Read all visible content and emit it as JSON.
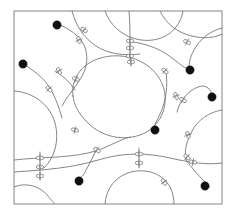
{
  "figure": {
    "canvas": {
      "width": 236,
      "height": 215
    },
    "background_color": "#ffffff",
    "frame": {
      "name": "bounding-frame",
      "x": 14,
      "y": 11,
      "width": 208,
      "height": 193,
      "stroke_color": "#8e8e8e",
      "stroke_width": 1.1,
      "fill_color": "#ffffff"
    },
    "style": {
      "curve_color": "#6f6f6f",
      "curve_width": 0.85,
      "crossing_color": "#7a7a7a",
      "crossing_fill": "#ffffff",
      "dot_color": "#101010",
      "dot_radius": 4.2
    },
    "curves": [
      {
        "id": "curve-central-loop",
        "label": "large central closed loop",
        "d": "M 73 96 C 70 74 88 58 111 56 C 134 54 156 66 163 86 C 170 106 160 128 140 135 C 120 142 98 135 85 120 C 77 111 74 104 73 96 Z"
      },
      {
        "id": "curve-upper-left-arc",
        "label": "upper-left descending arc from dot",
        "d": "M 56 23 C 68 28 79 35 84 45 C 89 56 87 68 81 78 C 75 88 67 96 62 106"
      },
      {
        "id": "curve-left-upper-sweep",
        "label": "left sweep from left dot through mid-left",
        "d": "M 22 63 C 33 70 44 78 50 88 C 56 98 59 108 62 118"
      },
      {
        "id": "curve-left-big-circle",
        "label": "left partial circle exiting frame",
        "d": "M 14 91 C 32 92 48 103 54 120 C 60 137 56 156 44 168"
      },
      {
        "id": "curve-top-left-to-top",
        "label": "top boundary arc near top-left",
        "d": "M 72 11 C 76 26 84 38 96 46 C 108 54 124 56 140 54"
      },
      {
        "id": "curve-top-center-dome",
        "label": "top-center dome arc",
        "d": "M 105 11 C 110 25 121 35 136 39 C 152 43 168 38 176 27 C 180 22 182 17 183 11"
      },
      {
        "id": "curve-top-right-arc",
        "label": "top-right arc to right border",
        "d": "M 160 11 C 166 24 178 33 192 36 C 204 39 214 38 222 34"
      },
      {
        "id": "curve-right-upper-hook",
        "label": "right upper hook ending at dot",
        "d": "M 222 28 C 210 31 200 39 194 50 C 190 57 189 63 189 68"
      },
      {
        "id": "curve-upper-right-branch",
        "label": "branch from top-center crossing to right dot",
        "d": "M 133 42 C 148 44 162 50 172 58 C 180 64 186 70 189 68"
      },
      {
        "id": "curve-right-swing",
        "label": "right side swing to right-edge dot",
        "d": "M 177 112 C 180 100 188 91 198 87 C 206 84 212 89 212 97"
      },
      {
        "id": "curve-right-lower-s",
        "label": "right lower S curve",
        "d": "M 222 110 C 209 112 198 120 192 131 C 186 142 184 152 186 160"
      },
      {
        "id": "curve-center-to-dot",
        "label": "arc from central loop to center dot",
        "d": "M 166 72 C 168 86 166 100 161 112 C 157 121 153 127 154 129"
      },
      {
        "id": "curve-center-bottom-strand",
        "label": "long bottom strand crossing center",
        "d": "M 14 160 C 40 157 66 158 88 153 C 106 149 118 140 130 137"
      },
      {
        "id": "curve-bottom-long-sweep",
        "label": "long sweep across lower area",
        "d": "M 14 172 C 44 170 72 168 98 160 C 124 152 148 153 170 158 C 192 163 208 165 222 163"
      },
      {
        "id": "curve-bottom-left-circle",
        "label": "bottom-left partial circle",
        "d": "M 14 187 C 26 182 40 186 48 196 C 52 201 54 203 55 204"
      },
      {
        "id": "curve-bottom-center-dome",
        "label": "bottom-center dome arc",
        "d": "M 105 204 C 106 188 116 176 131 172 C 147 168 163 174 170 187 C 173 193 174 199 174 204"
      },
      {
        "id": "curve-bottom-dot-hook",
        "label": "hook from bottom strand to bottom-left dot",
        "d": "M 97 147 C 94 155 90 163 86 170 C 84 175 81 178 79 179"
      },
      {
        "id": "curve-bottom-right-tail",
        "label": "tail to bottom-right dot",
        "d": "M 186 160 C 192 168 198 175 204 181 C 207 184 209 186 210 187"
      },
      {
        "id": "curve-mid-left-link",
        "label": "mid-left link joining loop and left arc",
        "d": "M 55 71 C 63 76 70 82 75 90"
      },
      {
        "id": "curve-center-vertical",
        "label": "vertical strand through center-top crossings",
        "d": "M 129 11 C 130 22 130 32 130 44 C 130 54 130 60 131 66"
      },
      {
        "id": "curve-left-vertical-ladder",
        "label": "short vertical strand crossing three horizontals",
        "d": "M 40 152 C 40 162 40 172 40 180"
      },
      {
        "id": "curve-bottom-right-vertical",
        "label": "vertical strand near bottom-center right",
        "d": "M 139 148 C 139 156 139 162 139 168"
      }
    ],
    "crossings": [
      {
        "id": "crossing-1",
        "label": "crossing upper-left",
        "x": 84,
        "y": 30,
        "angle": 35
      },
      {
        "id": "crossing-2",
        "label": "crossing upper-left lower",
        "x": 79,
        "y": 40,
        "angle": 70
      },
      {
        "id": "crossing-3",
        "label": "crossing top-center upper",
        "x": 130,
        "y": 41,
        "angle": 0
      },
      {
        "id": "crossing-4",
        "label": "crossing top-center mid",
        "x": 130,
        "y": 48,
        "angle": 0
      },
      {
        "id": "crossing-5",
        "label": "crossing top-center lower",
        "x": 130,
        "y": 56,
        "angle": 0
      },
      {
        "id": "crossing-6",
        "label": "crossing top-right",
        "x": 187,
        "y": 42,
        "angle": 25
      },
      {
        "id": "crossing-7",
        "label": "crossing left-mid upper",
        "x": 59,
        "y": 71,
        "angle": 60
      },
      {
        "id": "crossing-8",
        "label": "crossing left-mid lower",
        "x": 49,
        "y": 89,
        "angle": 45
      },
      {
        "id": "crossing-9",
        "label": "crossing central-left",
        "x": 76,
        "y": 79,
        "angle": 20
      },
      {
        "id": "crossing-10",
        "label": "crossing central-loop top",
        "x": 131,
        "y": 62,
        "angle": 0
      },
      {
        "id": "crossing-11",
        "label": "crossing central-loop right",
        "x": 165,
        "y": 71,
        "angle": 40
      },
      {
        "id": "crossing-12",
        "label": "crossing right-mid upper",
        "x": 176,
        "y": 96,
        "angle": 70
      },
      {
        "id": "crossing-13",
        "label": "crossing right-mid lower",
        "x": 183,
        "y": 100,
        "angle": 30
      },
      {
        "id": "crossing-14",
        "label": "crossing left-loop lower",
        "x": 75,
        "y": 130,
        "angle": 15
      },
      {
        "id": "crossing-15",
        "label": "crossing right-lower",
        "x": 188,
        "y": 135,
        "angle": 70
      },
      {
        "id": "crossing-16",
        "label": "crossing bottom-center-left",
        "x": 97,
        "y": 150,
        "angle": 35
      },
      {
        "id": "crossing-17",
        "label": "crossing bottom-vertical upper",
        "x": 40,
        "y": 158,
        "angle": 0
      },
      {
        "id": "crossing-18",
        "label": "crossing bottom-vertical mid",
        "x": 40,
        "y": 167,
        "angle": 0
      },
      {
        "id": "crossing-19",
        "label": "crossing bottom-vertical lower",
        "x": 40,
        "y": 176,
        "angle": 0
      },
      {
        "id": "crossing-20",
        "label": "crossing bottom-center upper",
        "x": 139,
        "y": 154,
        "angle": 0
      },
      {
        "id": "crossing-21",
        "label": "crossing bottom-center lower",
        "x": 139,
        "y": 163,
        "angle": 0
      },
      {
        "id": "crossing-22",
        "label": "crossing bottom-right",
        "x": 187,
        "y": 157,
        "angle": 40
      },
      {
        "id": "crossing-23",
        "label": "crossing bottom-right-lower",
        "x": 193,
        "y": 162,
        "angle": 10
      },
      {
        "id": "crossing-24",
        "label": "crossing bottom-dome-right",
        "x": 164,
        "y": 182,
        "angle": 55
      }
    ],
    "dots": [
      {
        "id": "dot-top-left",
        "label": "terminal node top-left",
        "x": 57,
        "y": 25
      },
      {
        "id": "dot-left",
        "label": "terminal node left",
        "x": 23,
        "y": 64
      },
      {
        "id": "dot-top-right",
        "label": "terminal node top-right",
        "x": 190,
        "y": 70
      },
      {
        "id": "dot-right",
        "label": "terminal node right edge",
        "x": 212,
        "y": 97
      },
      {
        "id": "dot-center",
        "label": "terminal node center",
        "x": 155,
        "y": 130
      },
      {
        "id": "dot-bottom-left",
        "label": "terminal node bottom-left",
        "x": 79,
        "y": 181
      },
      {
        "id": "dot-bottom-right",
        "label": "terminal node bottom-right",
        "x": 205,
        "y": 186
      }
    ]
  }
}
